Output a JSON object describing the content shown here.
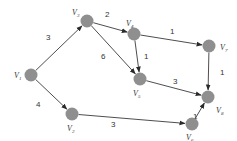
{
  "diagram": {
    "type": "weighted-directed-graph",
    "node_color": "#8f8f8f",
    "edge_color": "#3a3a3a",
    "nodes": [
      {
        "id": "V1",
        "base": "V",
        "sub": "1",
        "x": 31,
        "y": 75,
        "label_x": 14,
        "label_y": 78
      },
      {
        "id": "V2",
        "base": "V",
        "sub": "2",
        "x": 72,
        "y": 114,
        "label_x": 67,
        "label_y": 131
      },
      {
        "id": "V3",
        "base": "V",
        "sub": "3",
        "x": 87,
        "y": 21,
        "label_x": 72,
        "label_y": 15
      },
      {
        "id": "V4",
        "base": "V",
        "sub": "4",
        "x": 134,
        "y": 34,
        "label_x": 126,
        "label_y": 26
      },
      {
        "id": "V5",
        "base": "V",
        "sub": "5",
        "x": 140,
        "y": 79,
        "label_x": 133,
        "label_y": 96
      },
      {
        "id": "V6",
        "base": "V",
        "sub": "6",
        "x": 192,
        "y": 124,
        "label_x": 186,
        "label_y": 140
      },
      {
        "id": "V7",
        "base": "V",
        "sub": "7",
        "x": 209,
        "y": 46,
        "label_x": 220,
        "label_y": 50
      },
      {
        "id": "V8",
        "base": "V",
        "sub": "8",
        "x": 208,
        "y": 97,
        "label_x": 216,
        "label_y": 113
      }
    ],
    "edges": [
      {
        "from": "V1",
        "to": "V3",
        "weight": "3",
        "wx": 46,
        "wy": 40
      },
      {
        "from": "V1",
        "to": "V2",
        "weight": "4",
        "wx": 36,
        "wy": 107
      },
      {
        "from": "V3",
        "to": "V4",
        "weight": "2",
        "wx": 105,
        "wy": 17
      },
      {
        "from": "V3",
        "to": "V5",
        "weight": "6",
        "wx": 101,
        "wy": 59
      },
      {
        "from": "V4",
        "to": "V7",
        "weight": "1",
        "wx": 170,
        "wy": 34
      },
      {
        "from": "V4",
        "to": "V5",
        "weight": "1",
        "wx": 144,
        "wy": 59
      },
      {
        "from": "V5",
        "to": "V8",
        "weight": "3",
        "wx": 173,
        "wy": 84
      },
      {
        "from": "V7",
        "to": "V8",
        "weight": "1",
        "wx": 220,
        "wy": 75
      },
      {
        "from": "V2",
        "to": "V6",
        "weight": "3",
        "wx": 111,
        "wy": 127
      },
      {
        "from": "V6",
        "to": "V8",
        "weight": "1",
        "wx": 193,
        "wy": 119
      }
    ]
  }
}
